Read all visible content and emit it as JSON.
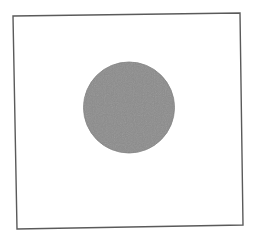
{
  "image": {
    "width": 259,
    "height": 240,
    "background": "#ffffff"
  },
  "frame": {
    "shape": "square-outline",
    "points": "13,16 240,13 243,225 17,229",
    "stroke": "#5a5a5a",
    "stroke_width": 1.4
  },
  "disc": {
    "shape": "filled-circle",
    "cx": 129,
    "cy": 107.5,
    "rx": 45.5,
    "ry": 45.5,
    "fill": "#8c8c8c",
    "edge": "#7e7e7e"
  }
}
